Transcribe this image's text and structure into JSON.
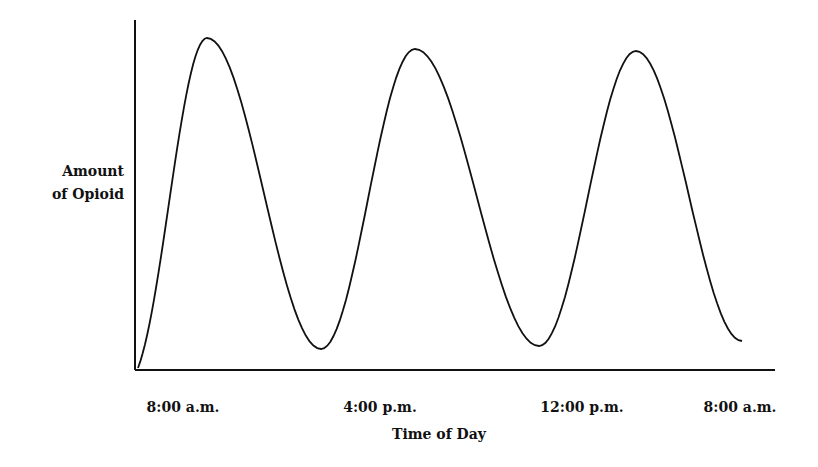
{
  "chart_data": {
    "type": "line",
    "title": "",
    "xlabel": "Time of Day",
    "ylabel_lines": [
      "Amount",
      "of Opioid"
    ],
    "ylabel": "Amount of Opioid",
    "x_ticks": [
      "8:00 a.m.",
      "4:00 p.m.",
      "12:00 p.m.",
      "8:00 a.m."
    ],
    "grid": false,
    "legend": null,
    "y_ticks": [],
    "x_hours_from_start": [
      0,
      8,
      16,
      24
    ],
    "series": [
      {
        "name": "Amount of Opioid",
        "color": "#111111",
        "points": [
          {
            "x": 0.0,
            "y": 0.02,
            "px": 138,
            "py": 368
          },
          {
            "x": 2.3,
            "y": 0.98,
            "px": 207,
            "py": 38
          },
          {
            "x": 6.1,
            "y": 0.06,
            "px": 321,
            "py": 349
          },
          {
            "x": 9.3,
            "y": 0.95,
            "px": 415,
            "py": 49
          },
          {
            "x": 13.4,
            "y": 0.07,
            "px": 539,
            "py": 346
          },
          {
            "x": 16.7,
            "y": 0.94,
            "px": 636,
            "py": 51
          },
          {
            "x": 20.2,
            "y": 0.09,
            "px": 742,
            "py": 341
          }
        ]
      }
    ],
    "axes": {
      "x_axis": {
        "x1": 135,
        "x2": 775,
        "y": 370
      },
      "y_axis": {
        "x": 135,
        "y1": 20,
        "y2": 370
      }
    },
    "tick_positions_px": [
      183,
      380,
      582,
      740
    ]
  }
}
